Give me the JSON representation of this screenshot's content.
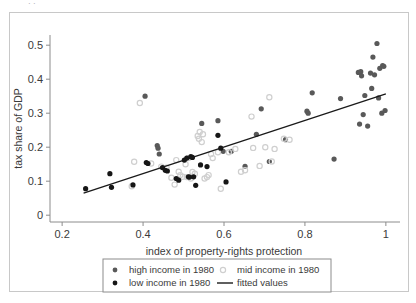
{
  "figure": {
    "top_artifact_text": "· ·",
    "frame_color": "#c8c8c8",
    "background": "#ffffff"
  },
  "chart_data": {
    "type": "scatter",
    "title": "",
    "xlabel": "index of property-rights protection",
    "ylabel": "tax share of GDP",
    "xlim": [
      0.17,
      1.03
    ],
    "ylim": [
      -0.02,
      0.53
    ],
    "xticks": [
      0.2,
      0.4,
      0.6,
      0.8,
      1
    ],
    "xtick_labels": [
      "0.2",
      "0.4",
      "0.6",
      "0.8",
      "1"
    ],
    "yticks": [
      0,
      0.1,
      0.2,
      0.3,
      0.4,
      0.5
    ],
    "ytick_labels": [
      "0",
      "0.1",
      "0.2",
      "0.3",
      "0.4",
      "0.5"
    ],
    "grid": false,
    "legend_position": "below-axes",
    "series": [
      {
        "name": "high income in 1980",
        "marker": "filled-circle",
        "color": "#595959",
        "points": [
          [
            0.405,
            0.35
          ],
          [
            0.435,
            0.205
          ],
          [
            0.437,
            0.197
          ],
          [
            0.44,
            0.18
          ],
          [
            0.545,
            0.27
          ],
          [
            0.585,
            0.278
          ],
          [
            0.598,
            0.188
          ],
          [
            0.618,
            0.188
          ],
          [
            0.652,
            0.144
          ],
          [
            0.68,
            0.238
          ],
          [
            0.692,
            0.313
          ],
          [
            0.712,
            0.158
          ],
          [
            0.752,
            0.222
          ],
          [
            0.805,
            0.306
          ],
          [
            0.808,
            0.3
          ],
          [
            0.818,
            0.36
          ],
          [
            0.872,
            0.165
          ],
          [
            0.888,
            0.343
          ],
          [
            0.932,
            0.42
          ],
          [
            0.935,
            0.268
          ],
          [
            0.938,
            0.422
          ],
          [
            0.94,
            0.41
          ],
          [
            0.944,
            0.296
          ],
          [
            0.948,
            0.352
          ],
          [
            0.955,
            0.262
          ],
          [
            0.962,
            0.418
          ],
          [
            0.965,
            0.373
          ],
          [
            0.968,
            0.465
          ],
          [
            0.972,
            0.413
          ],
          [
            0.978,
            0.505
          ],
          [
            0.982,
            0.345
          ],
          [
            0.985,
            0.432
          ],
          [
            0.99,
            0.3
          ],
          [
            0.992,
            0.44
          ],
          [
            0.995,
            0.438
          ],
          [
            0.998,
            0.308
          ]
        ]
      },
      {
        "name": "mid income in 1980",
        "marker": "open-circle",
        "color": "#cfcfcf",
        "points": [
          [
            0.392,
            0.33
          ],
          [
            0.378,
            0.157
          ],
          [
            0.372,
            0.085
          ],
          [
            0.42,
            0.152
          ],
          [
            0.445,
            0.143
          ],
          [
            0.458,
            0.14
          ],
          [
            0.47,
            0.11
          ],
          [
            0.478,
            0.09
          ],
          [
            0.482,
            0.162
          ],
          [
            0.488,
            0.128
          ],
          [
            0.492,
            0.118
          ],
          [
            0.498,
            0.113
          ],
          [
            0.505,
            0.15
          ],
          [
            0.508,
            0.112
          ],
          [
            0.512,
            0.168
          ],
          [
            0.518,
            0.108
          ],
          [
            0.522,
            0.127
          ],
          [
            0.528,
            0.122
          ],
          [
            0.535,
            0.233
          ],
          [
            0.538,
            0.225
          ],
          [
            0.54,
            0.245
          ],
          [
            0.545,
            0.215
          ],
          [
            0.548,
            0.238
          ],
          [
            0.552,
            0.108
          ],
          [
            0.558,
            0.112
          ],
          [
            0.562,
            0.118
          ],
          [
            0.568,
            0.18
          ],
          [
            0.572,
            0.168
          ],
          [
            0.585,
            0.185
          ],
          [
            0.592,
            0.078
          ],
          [
            0.612,
            0.185
          ],
          [
            0.628,
            0.195
          ],
          [
            0.642,
            0.128
          ],
          [
            0.652,
            0.132
          ],
          [
            0.668,
            0.29
          ],
          [
            0.672,
            0.198
          ],
          [
            0.688,
            0.145
          ],
          [
            0.702,
            0.2
          ],
          [
            0.712,
            0.347
          ],
          [
            0.718,
            0.158
          ],
          [
            0.725,
            0.195
          ],
          [
            0.748,
            0.225
          ],
          [
            0.762,
            0.222
          ]
        ]
      },
      {
        "name": "low income in 1980",
        "marker": "filled-circle",
        "color": "#161616",
        "points": [
          [
            0.258,
            0.078
          ],
          [
            0.318,
            0.122
          ],
          [
            0.322,
            0.082
          ],
          [
            0.375,
            0.089
          ],
          [
            0.408,
            0.155
          ],
          [
            0.412,
            0.152
          ],
          [
            0.448,
            0.14
          ],
          [
            0.455,
            0.132
          ],
          [
            0.46,
            0.13
          ],
          [
            0.482,
            0.108
          ],
          [
            0.488,
            0.103
          ],
          [
            0.502,
            0.162
          ],
          [
            0.508,
            0.168
          ],
          [
            0.512,
            0.113
          ],
          [
            0.515,
            0.112
          ],
          [
            0.518,
            0.172
          ],
          [
            0.522,
            0.17
          ],
          [
            0.525,
            0.113
          ],
          [
            0.53,
            0.088
          ],
          [
            0.542,
            0.148
          ],
          [
            0.558,
            0.143
          ],
          [
            0.585,
            0.235
          ],
          [
            0.592,
            0.197
          ],
          [
            0.605,
            0.098
          ]
        ]
      }
    ],
    "fit_line": {
      "name": "fitted values",
      "color": "#1a1a1a",
      "x0": 0.253,
      "y0": 0.065,
      "x1": 1.0,
      "y1": 0.357
    }
  },
  "legend": {
    "entries": [
      {
        "label": "high income in 1980",
        "marker": "filled-circle",
        "color": "#595959"
      },
      {
        "label": "mid income in 1980",
        "marker": "open-circle",
        "color": "#cfcfcf"
      },
      {
        "label": "low income in 1980",
        "marker": "filled-circle",
        "color": "#161616"
      },
      {
        "label": "fitted values",
        "marker": "line",
        "color": "#1a1a1a"
      }
    ]
  }
}
